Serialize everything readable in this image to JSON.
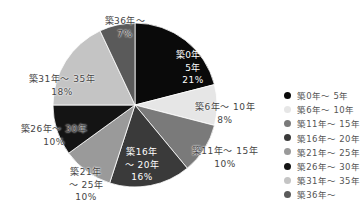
{
  "chart_data": {
    "type": "pie",
    "title": "",
    "categories": [
      "築0年～5年",
      "築6年～10年",
      "築11年～15年",
      "築16年～20年",
      "築21年～25年",
      "築26年～30年",
      "築31年～35年",
      "築36年～"
    ],
    "values": [
      21,
      8,
      10,
      16,
      10,
      10,
      18,
      7
    ],
    "unit": "%",
    "colors": [
      "#0a0a0a",
      "#e6e6e6",
      "#7a7a7a",
      "#3a3a3a",
      "#9a9a9a",
      "#141414",
      "#c4c4c4",
      "#5a5a5a"
    ],
    "legend_position": "right",
    "start_angle": "12 o'clock, clockwise"
  },
  "slice_labels": [
    {
      "line1": "築0年～",
      "line2": "5年",
      "pct": "21%"
    },
    {
      "line1": "築6年～ 10年",
      "line2": "8%",
      "pct": ""
    },
    {
      "line1": "築11年～ 15年",
      "line2": "10%",
      "pct": ""
    },
    {
      "line1": "築16年",
      "line2": "～ 20年",
      "pct": "16%"
    },
    {
      "line1": "築21年",
      "line2": "～ 25年",
      "pct": "10%"
    },
    {
      "line1": "築26年～ 30年",
      "line2": "10%",
      "pct": ""
    },
    {
      "line1": "築31年～ 35年",
      "line2": "18%",
      "pct": ""
    },
    {
      "line1": "築36年～",
      "line2": "7%",
      "pct": ""
    }
  ],
  "legend": [
    {
      "label": "築0年～ 5年",
      "color": "#0a0a0a"
    },
    {
      "label": "築6年～ 10年",
      "color": "#e6e6e6"
    },
    {
      "label": "築11年～ 15年",
      "color": "#7a7a7a"
    },
    {
      "label": "築16年～ 20年",
      "color": "#3a3a3a"
    },
    {
      "label": "築21年～ 25年",
      "color": "#9a9a9a"
    },
    {
      "label": "築26年～ 30年",
      "color": "#141414"
    },
    {
      "label": "築31年～ 35年",
      "color": "#c4c4c4"
    },
    {
      "label": "築36年～",
      "color": "#5a5a5a"
    }
  ]
}
